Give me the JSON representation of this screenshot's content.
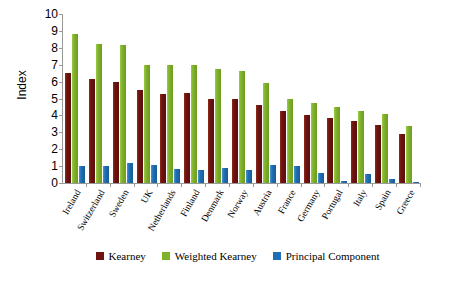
{
  "chart_data": {
    "type": "bar",
    "title": "",
    "xlabel": "",
    "ylabel": "Index",
    "ylim": [
      0,
      10
    ],
    "yticks": [
      0,
      1,
      2,
      3,
      4,
      5,
      6,
      7,
      8,
      9,
      10
    ],
    "grid": false,
    "legend_position": "bottom",
    "categories": [
      "Ireland",
      "Switzerland",
      "Sweden",
      "UK",
      "Netherlands",
      "Finland",
      "Denmark",
      "Norway",
      "Austria",
      "France",
      "Germany",
      "Portugal",
      "Italy",
      "Spain",
      "Greece"
    ],
    "series": [
      {
        "name": "Kearney",
        "color": "#6d1310",
        "values": [
          6.5,
          6.15,
          6.0,
          5.5,
          5.25,
          5.35,
          5.0,
          5.0,
          4.6,
          4.25,
          4.0,
          3.85,
          3.65,
          3.45,
          2.9
        ]
      },
      {
        "name": "Weighted Kearney",
        "color": "#7fb32a",
        "values": [
          8.8,
          8.25,
          8.15,
          7.0,
          7.0,
          7.0,
          6.75,
          6.6,
          5.9,
          5.0,
          4.75,
          4.5,
          4.25,
          4.1,
          3.35
        ]
      },
      {
        "name": "Principal Component",
        "color": "#1f6fb5",
        "values": [
          1.0,
          1.0,
          1.2,
          1.05,
          0.8,
          0.75,
          0.9,
          0.75,
          1.05,
          1.0,
          0.6,
          0.1,
          0.55,
          0.25,
          0.05
        ]
      }
    ]
  }
}
